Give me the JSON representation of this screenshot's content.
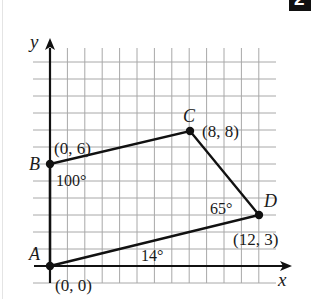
{
  "badge": {
    "text": "2"
  },
  "axes": {
    "x_label": "x",
    "y_label": "y"
  },
  "grid": {
    "columns": 12,
    "rows": 12,
    "origin_px": [
      50,
      266
    ],
    "cell_w": 17.4,
    "cell_h": 17.0
  },
  "points": [
    {
      "name": "A",
      "coord_label": "(0, 0)",
      "x": 0,
      "y": 0
    },
    {
      "name": "B",
      "coord_label": "(0, 6)",
      "x": 0,
      "y": 6
    },
    {
      "name": "C",
      "coord_label": "(8, 8)",
      "x": 8,
      "y": 8
    },
    {
      "name": "D",
      "coord_label": "(12, 3)",
      "x": 12,
      "y": 3
    }
  ],
  "angles": [
    {
      "vertex": "B",
      "label": "100°"
    },
    {
      "vertex": "D",
      "label": "65°"
    },
    {
      "vertex": "A",
      "label": "14°"
    }
  ],
  "colors": {
    "grid": "#a8a8a8",
    "ink": "#111111"
  }
}
